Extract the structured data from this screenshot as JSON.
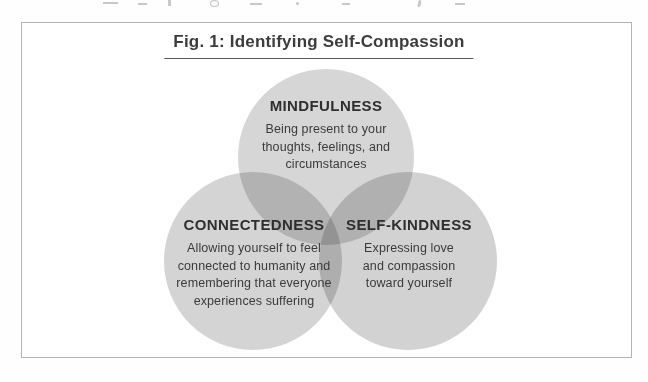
{
  "figure": {
    "title": "Fig. 1: Identifying Self-Compassion",
    "circles": [
      {
        "id": "mindfulness",
        "heading": "MINDFULNESS",
        "description": "Being present to your thoughts, feelings, and circumstances"
      },
      {
        "id": "connectedness",
        "heading": "CONNECTEDNESS",
        "description": "Allowing yourself to feel connected to humanity and remembering that everyone experiences suffering"
      },
      {
        "id": "self-kindness",
        "heading": "SELF-KINDNESS",
        "description": "Expressing love and compassion toward yourself"
      }
    ],
    "colors": {
      "circle_fill": "#d6d6d6",
      "pairwise_overlap": "#b4b4b4",
      "triple_overlap": "#9a9a9a",
      "text": "#3a3a3a",
      "box_border": "#b3b3b3",
      "title_underline": "#555555"
    }
  }
}
